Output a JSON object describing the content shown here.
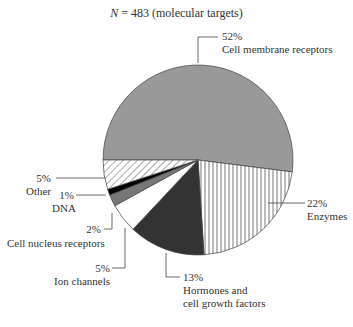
{
  "chart_data": {
    "type": "pie",
    "title": "N = 483 (molecular targets)",
    "title_n_label": "N",
    "title_rest": " = 483 (molecular targets)",
    "total": 483,
    "slices": [
      {
        "label": "Cell membrane receptors",
        "pct": 52,
        "pct_label": "52%",
        "fill": "#999999",
        "pattern": "solid"
      },
      {
        "label": "Enzymes",
        "pct": 22,
        "pct_label": "22%",
        "fill": "#ffffff",
        "pattern": "vertical-hatch"
      },
      {
        "label": "Hormones and cell growth factors",
        "pct": 13,
        "pct_label": "13%",
        "fill": "#333333",
        "pattern": "solid"
      },
      {
        "label": "Ion channels",
        "pct": 5,
        "pct_label": "5%",
        "fill": "#ffffff",
        "pattern": "solid"
      },
      {
        "label": "Cell nucleus receptors",
        "pct": 2,
        "pct_label": "2%",
        "fill": "#777777",
        "pattern": "solid"
      },
      {
        "label": "DNA",
        "pct": 1,
        "pct_label": "1%",
        "fill": "#000000",
        "pattern": "solid"
      },
      {
        "label": "Other",
        "pct": 5,
        "pct_label": "5%",
        "fill": "#ffffff",
        "pattern": "diagonal-hatch"
      }
    ],
    "labels": {
      "membrane_pct": "52%",
      "membrane_name": "Cell membrane receptors",
      "enzymes_pct": "22%",
      "enzymes_name": "Enzymes",
      "hormones_pct": "13%",
      "hormones_name1": "Hormones and",
      "hormones_name2": "cell growth factors",
      "ion_pct": "5%",
      "ion_name": "Ion channels",
      "nucleus_pct": "2%",
      "nucleus_name": "Cell nucleus receptors",
      "dna_pct": "1%",
      "dna_name": "DNA",
      "other_pct": "5%",
      "other_name": "Other"
    },
    "legend_position": "none",
    "grid": false
  }
}
